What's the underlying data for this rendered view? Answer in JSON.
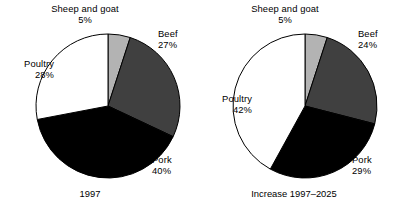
{
  "chart_data": [
    {
      "type": "pie",
      "title": "1997",
      "categories": [
        "Sheep and goat",
        "Beef",
        "Pork",
        "Poultry"
      ],
      "values": [
        5,
        27,
        40,
        28
      ],
      "value_labels": [
        "5%",
        "27%",
        "40%",
        "28%"
      ],
      "colors": [
        "#b3b3b3",
        "#404040",
        "#000000",
        "#ffffff"
      ],
      "start_angle_deg": 0,
      "direction": "clockwise",
      "legend": "none",
      "grid": false,
      "xlabel": "",
      "ylabel": ""
    },
    {
      "type": "pie",
      "title": "Increase 1997–2025",
      "categories": [
        "Sheep and goat",
        "Beef",
        "Pork",
        "Poultry"
      ],
      "values": [
        5,
        24,
        29,
        42
      ],
      "value_labels": [
        "5%",
        "24%",
        "29%",
        "42%"
      ],
      "colors": [
        "#b3b3b3",
        "#404040",
        "#000000",
        "#ffffff"
      ],
      "start_angle_deg": 0,
      "direction": "clockwise",
      "legend": "none",
      "grid": false,
      "xlabel": "",
      "ylabel": ""
    }
  ],
  "charts": {
    "left": {
      "caption": "1997",
      "slices": {
        "sheep": {
          "name": "Sheep and goat",
          "pct": "5%"
        },
        "beef": {
          "name": "Beef",
          "pct": "27%"
        },
        "pork": {
          "name": "Pork",
          "pct": "40%"
        },
        "poultry": {
          "name": "Poultry",
          "pct": "28%"
        }
      }
    },
    "right": {
      "caption": "Increase 1997–2025",
      "slices": {
        "sheep": {
          "name": "Sheep and goat",
          "pct": "5%"
        },
        "beef": {
          "name": "Beef",
          "pct": "24%"
        },
        "pork": {
          "name": "Pork",
          "pct": "29%"
        },
        "poultry": {
          "name": "Poultry",
          "pct": "42%"
        }
      }
    }
  },
  "style": {
    "stroke": "#000000",
    "background": "#ffffff"
  }
}
